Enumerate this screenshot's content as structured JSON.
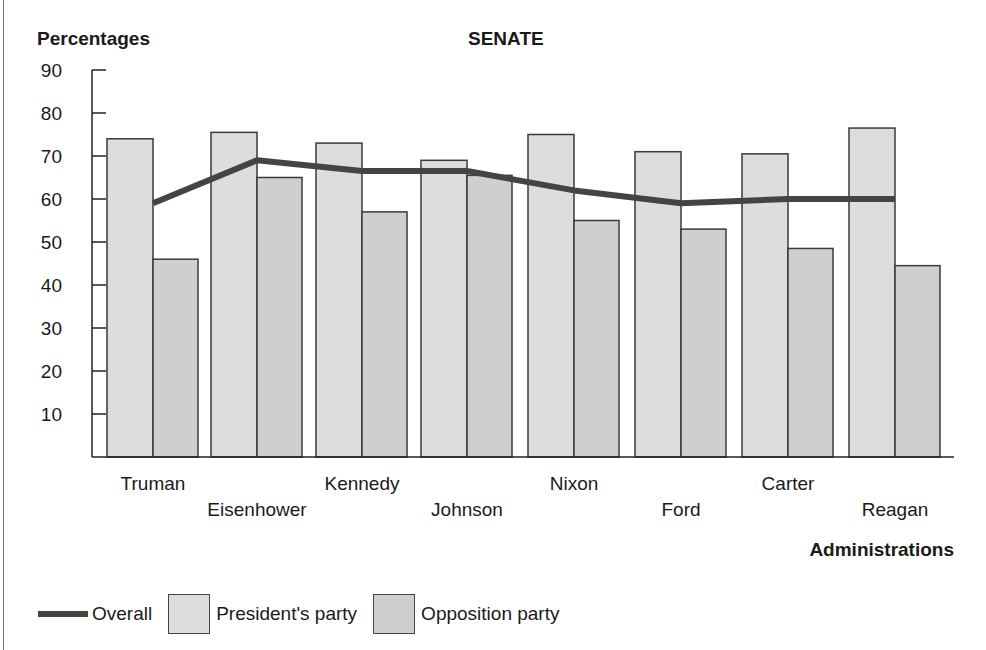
{
  "chart_data": {
    "type": "bar",
    "title": "SENATE",
    "ylabel": "Percentages",
    "xlabel": "Administrations",
    "ylim": [
      0,
      90
    ],
    "yticks": [
      10,
      20,
      30,
      40,
      50,
      60,
      70,
      80,
      90
    ],
    "grid": false,
    "legend_position": "bottom",
    "categories": [
      "Truman",
      "Eisenhower",
      "Kennedy",
      "Johnson",
      "Nixon",
      "Ford",
      "Carter",
      "Reagan"
    ],
    "series": [
      {
        "name": "President's party",
        "type": "bar",
        "color": "#dddddd",
        "values": [
          74,
          75.5,
          73,
          69,
          75,
          71,
          70.5,
          76.5
        ]
      },
      {
        "name": "Opposition party",
        "type": "bar",
        "color": "#cfcfcf",
        "values": [
          46,
          65,
          57,
          65.5,
          55,
          53,
          48.5,
          44.5
        ]
      },
      {
        "name": "Overall",
        "type": "line",
        "color": "#444444",
        "values": [
          59,
          69,
          66.5,
          66.5,
          62,
          59,
          60,
          60
        ]
      }
    ]
  },
  "legend": {
    "overall": "Overall",
    "president": "President's party",
    "opposition": "Opposition party"
  }
}
